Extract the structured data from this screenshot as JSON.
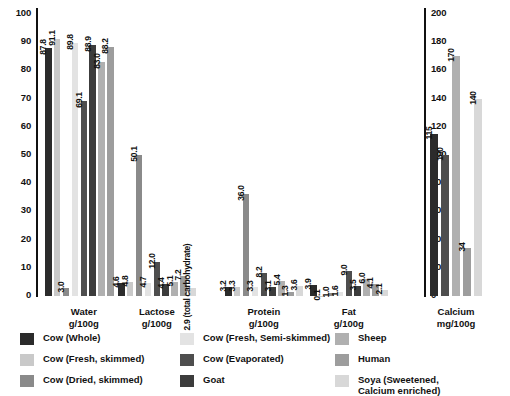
{
  "chart_data": {
    "type": "bar",
    "title": "",
    "xlabel": "",
    "ylabel": "",
    "grid": false,
    "legend_position": "bottom",
    "left_axis": {
      "label": "",
      "ylim": [
        0,
        100
      ],
      "ticks": [
        "0",
        "10",
        "20",
        "30",
        "40",
        "50",
        "60",
        "70",
        "80",
        "90",
        "100"
      ]
    },
    "right_axis": {
      "label": "",
      "ylim": [
        0,
        200
      ],
      "ticks": [
        "0",
        "20",
        "40",
        "60",
        "80",
        "100",
        "120",
        "140",
        "160",
        "180",
        "200"
      ]
    },
    "series": [
      {
        "name": "Cow (Whole)",
        "color": "#2b2b2b"
      },
      {
        "name": "Cow (Fresh, skimmed)",
        "color": "#c9c9c9"
      },
      {
        "name": "Cow (Dried, skimmed)",
        "color": "#8a8a8a"
      },
      {
        "name": "Cow (Fresh, Semi-skimmed)",
        "color": "#e3e3e3"
      },
      {
        "name": "Cow (Evaporated)",
        "color": "#4e4e4e"
      },
      {
        "name": "Goat",
        "color": "#3c3c3c"
      },
      {
        "name": "Sheep",
        "color": "#b0b0b0"
      },
      {
        "name": "Human",
        "color": "#9d9d9d"
      },
      {
        "name": "Soya (Sweetened, Calcium enriched)",
        "color": "#d8d8d8"
      }
    ],
    "groups": [
      {
        "key": "water",
        "name": "Water",
        "unit": "g/100g",
        "caption": "Water\ng/100g",
        "axis": "left",
        "values": [
          87.8,
          91.1,
          3.0,
          89.8,
          69.1,
          88.9,
          83.0,
          88.2,
          0
        ],
        "labels": [
          "87.8",
          "91.1",
          "3.0",
          "89.8",
          "69.1",
          "88.9",
          "83.0",
          "88.2",
          ""
        ]
      },
      {
        "key": "lactose",
        "name": "Lactose",
        "unit": "g/100g",
        "caption": "Lactose\ng/100g",
        "axis": "left",
        "values": [
          4.6,
          4.8,
          50.1,
          4.7,
          12.0,
          4.4,
          5.1,
          7.2,
          2.9
        ],
        "labels": [
          "4.6",
          "4.8",
          "50.1",
          "4.7",
          "12.0",
          "4.4",
          "5.1",
          "7.2",
          "2.9 (total carbohydrate)"
        ]
      },
      {
        "key": "protein",
        "name": "Protein",
        "unit": "g/100g",
        "caption": "Protein\ng/100g",
        "axis": "left",
        "values": [
          3.2,
          3.3,
          36.0,
          3.3,
          8.2,
          3.1,
          5.4,
          1.3,
          3.6
        ],
        "labels": [
          "3.2",
          "3.3",
          "36.0",
          "3.3",
          "8.2",
          "3.1",
          "5.4",
          "1.3",
          "3.6"
        ]
      },
      {
        "key": "fat",
        "name": "Fat",
        "unit": "g/100g",
        "caption": "Fat\ng/100g",
        "axis": "left",
        "values": [
          3.9,
          0.1,
          1.0,
          1.6,
          9.0,
          3.5,
          6.0,
          4.1,
          2.1
        ],
        "labels": [
          "3.9",
          "0.1",
          "1.0",
          "1.6",
          "9.0",
          "3.5",
          "6.0",
          "4.1",
          "2.1"
        ]
      },
      {
        "key": "calcium",
        "name": "Calcium",
        "unit": "mg/100g",
        "caption": "Calcium\nmg/100g",
        "axis": "right",
        "values": [
          115,
          100,
          170,
          34,
          140
        ],
        "labels": [
          "115",
          "100",
          "170",
          "34",
          "140"
        ],
        "series_index": [
          0,
          4,
          6,
          7,
          8
        ]
      }
    ]
  },
  "legend": {
    "columns": [
      [
        {
          "label": "Cow (Whole)",
          "color": "#2b2b2b"
        },
        {
          "label": "Cow (Fresh, skimmed)",
          "color": "#c9c9c9"
        },
        {
          "label": "Cow (Dried, skimmed)",
          "color": "#8a8a8a"
        }
      ],
      [
        {
          "label": "Cow (Fresh, Semi-skimmed)",
          "color": "#e3e3e3"
        },
        {
          "label": "Cow (Evaporated)",
          "color": "#4e4e4e"
        },
        {
          "label": "Goat",
          "color": "#3c3c3c"
        }
      ],
      [
        {
          "label": "Sheep",
          "color": "#b0b0b0"
        },
        {
          "label": "Human",
          "color": "#9d9d9d"
        },
        {
          "label": "Soya (Sweetened,\nCalcium enriched)",
          "color": "#d8d8d8"
        }
      ]
    ]
  }
}
